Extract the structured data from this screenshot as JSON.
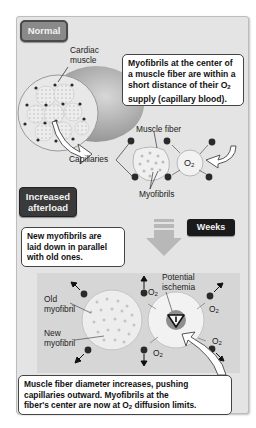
{
  "sections": {
    "normal": {
      "label": "Normal",
      "cardiac_label_line1": "Cardiac",
      "cardiac_label_line2": "muscle",
      "callout": {
        "line1": "Myofibrils at the center of",
        "line2": "a muscle fiber are within a",
        "line3_pre": "short distance of their O",
        "line3_sub": "2",
        "line4": "supply (capillary blood)."
      },
      "muscle_fiber_label": "Muscle fiber",
      "capillaries_label": "Capillaries",
      "myofibrils_label": "Myofibrils",
      "o2_label": "O",
      "o2_sub": "2"
    },
    "afterload": {
      "label_line1": "Increased",
      "label_line2": "afterload",
      "weeks_label": "Weeks",
      "callout": {
        "line1": "New myofibrils are",
        "line2": "laid down in parallel",
        "line3": "with old ones."
      },
      "old_myofibril_line1": "Old",
      "old_myofibril_line2": "myofibril",
      "new_myofibril_line1": "New",
      "new_myofibril_line2": "myofibril",
      "ischemia_line1": "Potential",
      "ischemia_line2": "ischemia",
      "o2_label": "O",
      "o2_sub": "2",
      "bottom_callout": {
        "line1": "Muscle fiber diameter increases, pushing",
        "line2": "capillaries outward. Myofibrils at the",
        "line3_pre": "fiber's center are now at O",
        "line3_sub": "2",
        "line3_post": " diffusion limits."
      }
    }
  },
  "colors": {
    "frame_bg": "#e4e4e4",
    "capillary": "#2a2a2a",
    "fiber_fill": "#f0f0f0",
    "dark_label": "#3a3a3a"
  }
}
